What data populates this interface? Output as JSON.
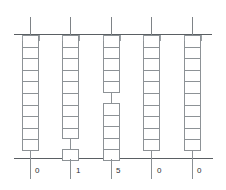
{
  "diagram": {
    "axis": {
      "top_label": "",
      "bottom_label": "",
      "line_color": "#5a5f63"
    },
    "columns": [
      {
        "id": "column-1",
        "label": "0",
        "x": 22,
        "center_x": 30,
        "width": 17,
        "cell_count": 10,
        "groups": [
          {
            "top": 35,
            "cells": 10
          }
        ],
        "stems": [
          {
            "top": 18,
            "height": 17
          },
          {
            "top": 147,
            "height": 32
          }
        ]
      },
      {
        "id": "column-2",
        "label": "1",
        "x": 62,
        "center_x": 70,
        "width": 17,
        "cell_count": 10,
        "groups": [
          {
            "top": 35,
            "cells": 9
          },
          {
            "top": 149,
            "cells": 1
          }
        ],
        "stems": [
          {
            "top": 18,
            "height": 17
          },
          {
            "top": 136,
            "height": 14
          },
          {
            "top": 161,
            "height": 18
          }
        ]
      },
      {
        "id": "column-3",
        "label": "5",
        "x": 103,
        "center_x": 111,
        "width": 17,
        "cell_count": 10,
        "groups": [
          {
            "top": 35,
            "cells": 5
          },
          {
            "top": 103,
            "cells": 5
          }
        ],
        "stems": [
          {
            "top": 18,
            "height": 17
          },
          {
            "top": 92,
            "height": 12
          },
          {
            "top": 159,
            "height": 20
          }
        ]
      },
      {
        "id": "column-4",
        "label": "0",
        "x": 143,
        "center_x": 151,
        "width": 17,
        "cell_count": 10,
        "groups": [
          {
            "top": 35,
            "cells": 10
          }
        ],
        "stems": [
          {
            "top": 18,
            "height": 17
          },
          {
            "top": 147,
            "height": 32
          }
        ]
      },
      {
        "id": "column-5",
        "label": "0",
        "x": 184,
        "center_x": 192,
        "width": 17,
        "cell_count": 10,
        "groups": [
          {
            "top": 35,
            "cells": 10
          }
        ],
        "stems": [
          {
            "top": 18,
            "height": 17
          },
          {
            "top": 147,
            "height": 32
          }
        ]
      }
    ],
    "minor_ticks_x": [
      22,
      39,
      62,
      79,
      103,
      120,
      143,
      160,
      184,
      201
    ],
    "labels": [
      "0",
      "1",
      "5",
      "0",
      "0"
    ],
    "label_positions_x": [
      35,
      76,
      116,
      157,
      197
    ],
    "label_y": 166,
    "colors": {
      "cell_border": "#8d9296",
      "axis": "#5a5f63",
      "tick": "#8b9094",
      "text": "#2b2f33",
      "background": "#ffffff"
    }
  }
}
